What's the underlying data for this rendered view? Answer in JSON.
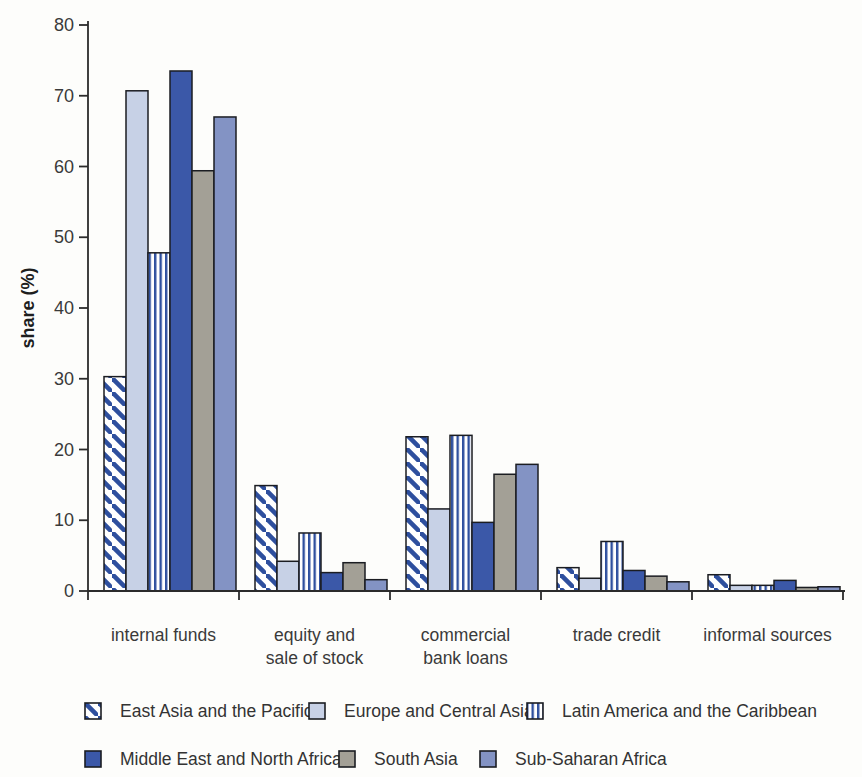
{
  "chart_data": {
    "type": "bar",
    "title": "",
    "ylabel": "share (%)",
    "xlabel": "",
    "ylim": [
      0,
      80
    ],
    "yticks": [
      0,
      10,
      20,
      30,
      40,
      50,
      60,
      70,
      80
    ],
    "grid": false,
    "legend_position": "bottom",
    "categories": [
      "internal funds",
      "equity and\nsale of stock",
      "commercial\nbank loans",
      "trade credit",
      "informal sources"
    ],
    "series": [
      {
        "name": "East Asia and the Pacific",
        "pattern": "diagonal",
        "fill": "#ffffff",
        "stripe": "#2e4f9e",
        "values": [
          30.3,
          14.9,
          21.8,
          3.3,
          2.3
        ]
      },
      {
        "name": "Europe and Central Asia",
        "pattern": "solid",
        "fill": "#c7d1e6",
        "values": [
          70.7,
          4.2,
          11.6,
          1.8,
          0.8
        ]
      },
      {
        "name": "Latin America and the Caribbean",
        "pattern": "vertical",
        "fill": "#ffffff",
        "stripe": "#2e4f9e",
        "values": [
          47.8,
          8.2,
          22.0,
          7.0,
          0.8
        ]
      },
      {
        "name": "Middle East and North Africa",
        "pattern": "solid",
        "fill": "#3b58a8",
        "values": [
          73.5,
          2.6,
          9.7,
          2.9,
          1.5
        ]
      },
      {
        "name": "South Asia",
        "pattern": "solid",
        "fill": "#a3a096",
        "values": [
          59.4,
          4.0,
          16.5,
          2.1,
          0.5
        ]
      },
      {
        "name": "Sub-Saharan Africa",
        "pattern": "solid",
        "fill": "#8393c4",
        "values": [
          67.0,
          1.6,
          17.9,
          1.3,
          0.6
        ]
      }
    ],
    "colors": {
      "bar_outline": "#1b1d22",
      "axis": "#2b2b2b",
      "text": "#3a3a3a"
    }
  }
}
